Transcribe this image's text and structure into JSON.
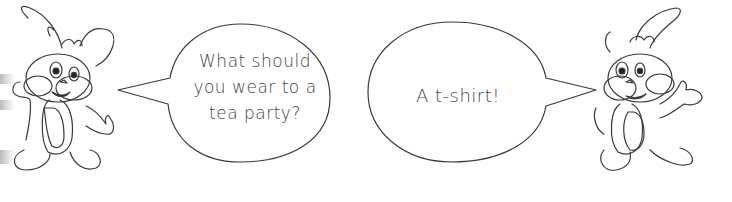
{
  "scene": {
    "left_speech": {
      "speaker": "left-bunny",
      "lines": [
        "What should",
        "you wear to a",
        "tea party?"
      ]
    },
    "right_speech": {
      "speaker": "right-bunny",
      "lines": [
        "A t-shirt!"
      ]
    },
    "colors": {
      "outline": "#333333",
      "text": "#444444",
      "background": "#ffffff"
    }
  }
}
